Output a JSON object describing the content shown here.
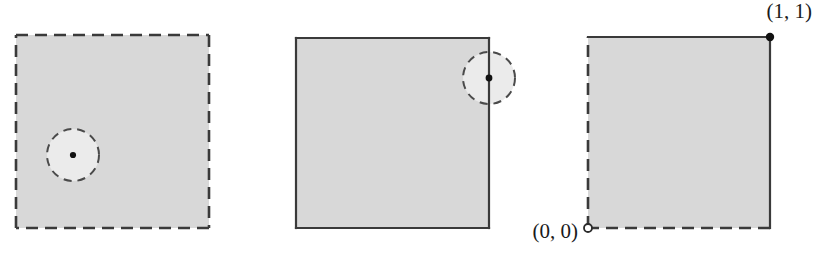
{
  "figure": {
    "type": "diagram",
    "background_color": "#ffffff",
    "square_fill_color": "#d8d8d8",
    "disk_fill_color": "#ebebeb",
    "edge_color": "#3a3a3a",
    "marker_color": "#111111",
    "panels": [
      {
        "id": "panel-open-square",
        "name": "open-square",
        "x": 16,
        "y": 35,
        "width": 193,
        "height": 193,
        "edges": {
          "top": "dashed",
          "right": "dashed",
          "bottom": "dashed",
          "left": "dashed"
        },
        "disk": {
          "name": "interior-point-disk",
          "cx": 73,
          "cy": 155,
          "r": 26,
          "stroke": "dashed",
          "center_marker": "filled-dot"
        }
      },
      {
        "id": "panel-closed-square",
        "name": "closed-square",
        "x": 296,
        "y": 38,
        "width": 193,
        "height": 190,
        "edges": {
          "top": "solid",
          "right": "solid",
          "bottom": "solid",
          "left": "solid"
        },
        "disk": {
          "name": "boundary-point-disk",
          "cx": 489,
          "cy": 78,
          "r": 26,
          "stroke": "dashed",
          "center_marker": "filled-dot"
        }
      },
      {
        "id": "panel-half-open-square",
        "name": "half-open-square",
        "x": 588,
        "y": 37,
        "width": 182,
        "height": 191,
        "edges": {
          "top": "solid",
          "right": "solid",
          "bottom": "dashed",
          "left": "dashed"
        },
        "disk": null,
        "points": [
          {
            "name": "point-one-one",
            "label": "(1, 1)",
            "x": 770,
            "y": 37,
            "marker": "filled-dot",
            "label_x": 812,
            "label_y": 18,
            "label_anchor": "end"
          },
          {
            "name": "point-zero-zero",
            "label": "(0, 0)",
            "x": 588,
            "y": 228,
            "marker": "open-circle",
            "label_x": 578,
            "label_y": 238,
            "label_anchor": "end"
          }
        ]
      }
    ]
  }
}
